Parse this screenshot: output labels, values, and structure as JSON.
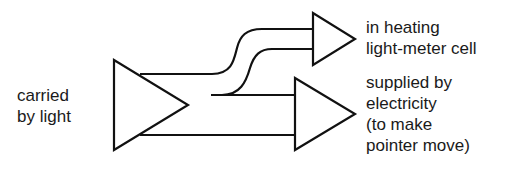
{
  "diagram": {
    "type": "energy-flow",
    "input_label": {
      "lines": [
        "carried",
        "by light"
      ]
    },
    "outputs": [
      {
        "id": "heating",
        "lines": [
          "in heating",
          "light-meter cell"
        ]
      },
      {
        "id": "electricity",
        "lines": [
          "supplied by",
          "electricity",
          "(to make",
          "pointer move)"
        ]
      }
    ],
    "stroke_color": "#111111",
    "background_color": "#ffffff"
  }
}
